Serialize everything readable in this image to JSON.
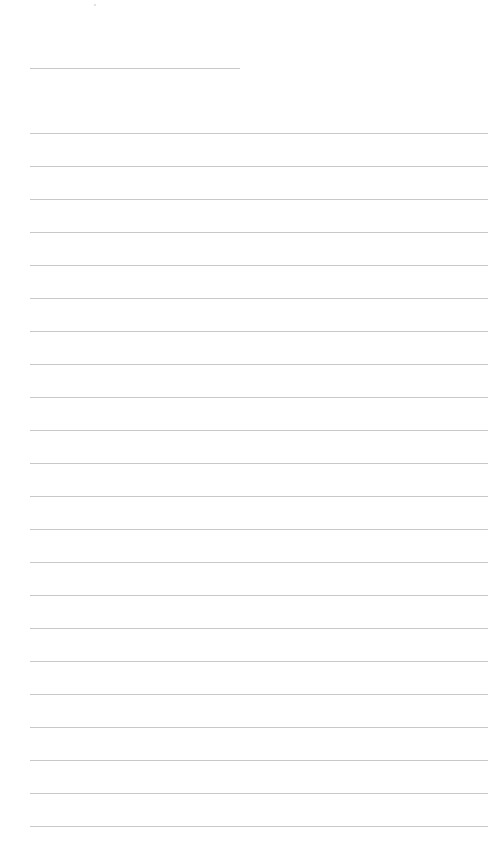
{
  "page": {
    "background": "#ffffff",
    "line_color": "#c8c8c8",
    "short_line": {
      "x": 30,
      "y": 68,
      "width": 210
    },
    "ruled_lines": {
      "x": 30,
      "width": 458,
      "start_y": 133,
      "spacing": 33,
      "count": 22
    }
  }
}
